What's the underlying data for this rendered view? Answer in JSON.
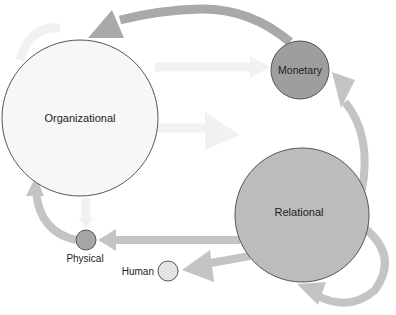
{
  "diagram": {
    "nodes": [
      {
        "id": "organizational",
        "label": "Organizational",
        "cx": 80,
        "cy": 118,
        "r": 78,
        "fill": "#f7f7f7",
        "font_size": 11
      },
      {
        "id": "monetary",
        "label": "Monetary",
        "cx": 300,
        "cy": 70,
        "r": 29,
        "fill": "#9e9e9e",
        "font_size": 11
      },
      {
        "id": "relational",
        "label": "Relational",
        "cx": 302,
        "cy": 215,
        "r": 67,
        "fill": "#bcbcbc",
        "font_size": 11
      },
      {
        "id": "physical",
        "label": "Physical",
        "cx": 86,
        "cy": 240,
        "r": 10,
        "fill": "#a6a6a6",
        "font_size": 10
      },
      {
        "id": "human",
        "label": "Human",
        "cx": 168,
        "cy": 271,
        "r": 10,
        "fill": "#e4e4e4",
        "font_size": 10
      }
    ],
    "edges": [
      {
        "from": "monetary",
        "to": "organizational",
        "style": "strong"
      },
      {
        "from": "relational",
        "to": "monetary",
        "style": "medium"
      },
      {
        "from": "relational",
        "to": "physical",
        "style": "medium"
      },
      {
        "from": "relational",
        "to": "human",
        "style": "medium"
      },
      {
        "from": "relational",
        "to": "relational",
        "style": "medium"
      },
      {
        "from": "physical",
        "to": "organizational",
        "style": "medium"
      },
      {
        "from": "organizational",
        "to": "monetary",
        "style": "faint"
      },
      {
        "from": "organizational",
        "to": "relational",
        "style": "faint"
      },
      {
        "from": "organizational",
        "to": "physical",
        "style": "faint"
      },
      {
        "from": "organizational",
        "to": "organizational",
        "style": "faint"
      }
    ],
    "colors": {
      "arrow_strong": "#a9a9a9",
      "arrow_medium": "#c4c4c4",
      "arrow_faint": "#f1f1f1",
      "outline": "#555555",
      "text": "#222222"
    }
  }
}
